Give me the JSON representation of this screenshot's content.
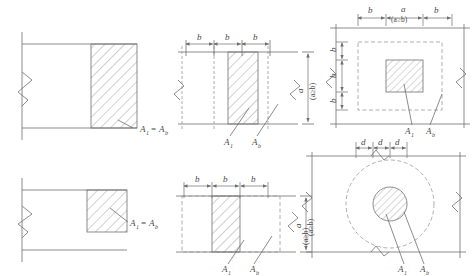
{
  "figure": {
    "type": "engineering-diagram",
    "background_color": "#ffffff",
    "line_color": "#6e6e6e",
    "hatch_color": "#8a8a8a",
    "dash_color": "#9a9a9a",
    "text_color": "#4a4a4a"
  },
  "labels": {
    "A1": "A",
    "A1_sub": "1",
    "Ab": "A",
    "Ab_sub": "b",
    "equals": "=",
    "b": "b",
    "a": "a",
    "d": "d",
    "condition": "(a≥b)"
  },
  "panels": [
    {
      "id": "top-left",
      "view": "elevation",
      "note": "A1 = Ab, full depth hatched block at right end with break symbol",
      "label": "A1 =Ab"
    },
    {
      "id": "top-middle",
      "view": "plan",
      "note": "three b dimensions across top, central hatched strip, vertical a (a≥b)",
      "dimensions_top": [
        "b",
        "b",
        "b"
      ],
      "dimension_right": "a (a≥b)",
      "leaders": [
        "A1",
        "Ab"
      ]
    },
    {
      "id": "top-right",
      "view": "plan",
      "note": "square hatched area centered in dashed rectangle",
      "dimensions_top": [
        "b",
        "a",
        "b"
      ],
      "dimensions_left": [
        "b",
        "b",
        "b"
      ],
      "condition": "(a≥b)",
      "leaders": [
        "A1",
        "Ab"
      ]
    },
    {
      "id": "bottom-left",
      "view": "elevation",
      "note": "A1 = Ab, partial depth hatched square at upper right with break symbol",
      "label": "A1 =Ab"
    },
    {
      "id": "bottom-middle",
      "view": "plan",
      "note": "three b dimensions, hatched strip, dashed outer boundary, vertical a (a≥b)",
      "dimensions_top": [
        "b",
        "b",
        "b"
      ],
      "dimension_right": "a (a≥b)",
      "leaders": [
        "A1",
        "Ab"
      ]
    },
    {
      "id": "bottom-right",
      "view": "plan",
      "note": "hatched circle A1 concentric inside dashed circle Ab",
      "dimensions_top": [
        "d",
        "d",
        "d"
      ],
      "dimension_left": "(a≥b)",
      "leaders": [
        "A1",
        "Ab"
      ]
    }
  ]
}
